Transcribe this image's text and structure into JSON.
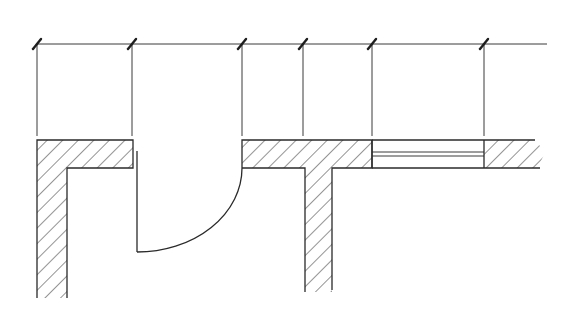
{
  "drawing": {
    "type": "architectural floor plan section",
    "line_color": "#2a2a2a",
    "background": "#ffffff",
    "dimension_line": {
      "y": 44,
      "x_start": 37,
      "x_end": 547,
      "tick_positions": [
        37,
        132,
        242,
        303,
        372,
        484
      ]
    },
    "elements": [
      {
        "name": "left-wall-corner",
        "kind": "hatched wall (L-shape)"
      },
      {
        "name": "door-opening",
        "kind": "swing door with quarter arc"
      },
      {
        "name": "middle-wall-tee",
        "kind": "hatched wall (T-junction)"
      },
      {
        "name": "window-opening",
        "kind": "window with double glazing lines"
      },
      {
        "name": "right-wall-segment",
        "kind": "hatched wall with break end"
      }
    ]
  }
}
